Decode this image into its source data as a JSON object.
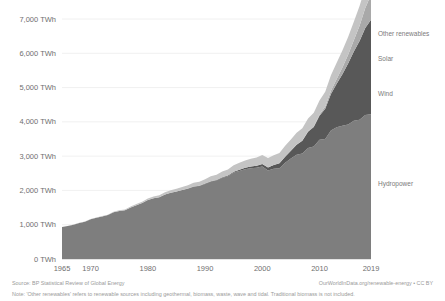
{
  "chart_data": {
    "type": "area",
    "stacked": true,
    "title": "",
    "subtitle": "",
    "xlabel": "",
    "ylabel": "",
    "grid": true,
    "legend_position": "right-inline",
    "xlim": [
      1965,
      2019
    ],
    "ylim": [
      0,
      7000
    ],
    "y_unit": "TWh",
    "y_ticks": [
      0,
      1000,
      2000,
      3000,
      4000,
      5000,
      6000,
      7000
    ],
    "y_tick_labels": [
      "0 TWh",
      "1,000 TWh",
      "2,000 TWh",
      "3,000 TWh",
      "4,000 TWh",
      "5,000 TWh",
      "6,000 TWh",
      "7,000 TWh"
    ],
    "x_ticks": [
      1965,
      1970,
      1980,
      1990,
      2000,
      2010,
      2019
    ],
    "x_tick_labels": [
      "1965",
      "1970",
      "1980",
      "1990",
      "2000",
      "2010",
      "2019"
    ],
    "x": [
      1965,
      1966,
      1967,
      1968,
      1969,
      1970,
      1971,
      1972,
      1973,
      1974,
      1975,
      1976,
      1977,
      1978,
      1979,
      1980,
      1981,
      1982,
      1983,
      1984,
      1985,
      1986,
      1987,
      1988,
      1989,
      1990,
      1991,
      1992,
      1993,
      1994,
      1995,
      1996,
      1997,
      1998,
      1999,
      2000,
      2001,
      2002,
      2003,
      2004,
      2005,
      2006,
      2007,
      2008,
      2009,
      2010,
      2011,
      2012,
      2013,
      2014,
      2015,
      2016,
      2017,
      2018,
      2019
    ],
    "series": [
      {
        "name": "Hydropower",
        "color": "#7e7e7e",
        "values": [
          930,
          960,
          1000,
          1050,
          1090,
          1160,
          1200,
          1240,
          1280,
          1360,
          1400,
          1420,
          1500,
          1570,
          1630,
          1720,
          1770,
          1800,
          1880,
          1930,
          1970,
          2010,
          2050,
          2110,
          2130,
          2190,
          2260,
          2290,
          2370,
          2410,
          2520,
          2570,
          2620,
          2650,
          2660,
          2700,
          2580,
          2630,
          2650,
          2810,
          2930,
          3040,
          3080,
          3240,
          3280,
          3480,
          3500,
          3750,
          3840,
          3890,
          3920,
          4030,
          4060,
          4200,
          4220
        ]
      },
      {
        "name": "Wind",
        "color": "#585858",
        "values": [
          0,
          0,
          0,
          0,
          0,
          0,
          0,
          0,
          0,
          0,
          0,
          0,
          0,
          0,
          0,
          0,
          0,
          0,
          0,
          1,
          2,
          3,
          4,
          5,
          7,
          9,
          11,
          13,
          17,
          22,
          28,
          33,
          38,
          46,
          58,
          72,
          92,
          113,
          140,
          175,
          225,
          290,
          370,
          470,
          570,
          700,
          880,
          1060,
          1270,
          1500,
          1780,
          2020,
          2300,
          2540,
          2760
        ]
      },
      {
        "name": "Solar",
        "color": "#a9a9a9",
        "values": [
          0,
          0,
          0,
          0,
          0,
          0,
          0,
          0,
          0,
          0,
          0,
          0,
          0,
          0,
          0,
          0,
          0,
          0,
          0,
          0,
          0,
          0,
          0,
          0,
          0,
          0,
          0,
          0,
          0,
          0,
          0,
          1,
          1,
          1,
          1,
          1,
          2,
          2,
          3,
          4,
          5,
          7,
          9,
          13,
          21,
          33,
          65,
          100,
          141,
          196,
          256,
          328,
          444,
          584,
          724
        ]
      },
      {
        "name": "Other renewables",
        "color": "#c4c4c4",
        "values": [
          2,
          3,
          4,
          5,
          6,
          8,
          10,
          12,
          14,
          17,
          20,
          24,
          28,
          33,
          38,
          44,
          50,
          57,
          64,
          72,
          80,
          89,
          98,
          108,
          118,
          130,
          142,
          154,
          166,
          178,
          190,
          203,
          216,
          229,
          243,
          257,
          270,
          284,
          298,
          312,
          327,
          342,
          358,
          375,
          392,
          410,
          430,
          450,
          472,
          495,
          519,
          545,
          572,
          600,
          630
        ]
      }
    ],
    "series_labels": [
      {
        "name": "Other renewables",
        "y_px": 36
      },
      {
        "name": "Solar",
        "y_px": 61
      },
      {
        "name": "Wind",
        "y_px": 96
      },
      {
        "name": "Hydropower",
        "y_px": 186
      }
    ]
  },
  "footer": {
    "source": "Source: BP Statistical Review of Global Energy",
    "credit": "OurWorldInData.org/renewable-energy • CC BY",
    "note": "Note: 'Other renewables' refers to renewable sources including geothermal, biomass, waste, wave and tidal. Traditional biomass is not included."
  }
}
